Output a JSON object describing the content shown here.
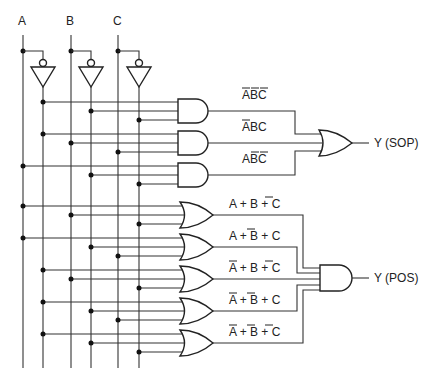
{
  "inputs": [
    {
      "label": "A",
      "x": 23,
      "nx": 43
    },
    {
      "label": "B",
      "x": 71,
      "nx": 91
    },
    {
      "label": "C",
      "x": 118,
      "nx": 139
    }
  ],
  "sop": {
    "output_label": "Y (SOP)",
    "terms": [
      {
        "text": "ABC",
        "overline": [
          true,
          true,
          true
        ],
        "inputs": [
          "A'",
          "B'",
          "C'"
        ]
      },
      {
        "text": "ABC",
        "overline": [
          true,
          false,
          false
        ],
        "inputs": [
          "A'",
          "B",
          "C"
        ]
      },
      {
        "text": "ABC",
        "overline": [
          false,
          true,
          true
        ],
        "inputs": [
          "A",
          "B'",
          "C'"
        ]
      }
    ]
  },
  "pos": {
    "output_label": "Y (POS)",
    "terms": [
      {
        "vars": [
          "A",
          "B",
          "C"
        ],
        "overline": [
          false,
          false,
          true
        ]
      },
      {
        "vars": [
          "A",
          "B",
          "C"
        ],
        "overline": [
          false,
          true,
          false
        ]
      },
      {
        "vars": [
          "A",
          "B",
          "C"
        ],
        "overline": [
          true,
          false,
          true
        ]
      },
      {
        "vars": [
          "A",
          "B",
          "C"
        ],
        "overline": [
          true,
          true,
          false
        ]
      },
      {
        "vars": [
          "A",
          "B",
          "C"
        ],
        "overline": [
          true,
          true,
          true
        ]
      }
    ]
  },
  "colors": {
    "line": "#333333",
    "background": "#ffffff"
  }
}
